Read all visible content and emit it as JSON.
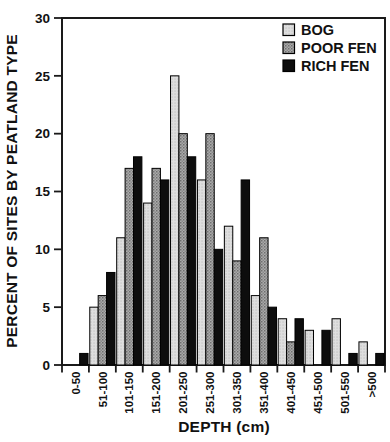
{
  "figure": {
    "background": "#ffffff",
    "frame_color": "#1a1a1a",
    "bar_outline_color": "#000000"
  },
  "chart_data": {
    "type": "bar",
    "title": "",
    "xlabel": "DEPTH (cm)",
    "ylabel": "PERCENT OF SITES BY PEATLAND TYPE",
    "ylim": [
      0,
      30
    ],
    "yticks": [
      0,
      5,
      10,
      15,
      20,
      25,
      30
    ],
    "grid": false,
    "legend_position": "top-right",
    "categories": [
      "0-50",
      "51-100",
      "101-150",
      "151-200",
      "201-250",
      "251-300",
      "301-350",
      "351-400",
      "401-450",
      "451-500",
      "501-550",
      ">500"
    ],
    "series": [
      {
        "name": "BOG",
        "pattern": "light-stipple",
        "fill_hex": "#d9d9d9",
        "values": [
          0,
          5,
          11,
          14,
          25,
          16,
          12,
          6,
          4,
          3,
          4,
          2
        ]
      },
      {
        "name": "POOR FEN",
        "pattern": "dark-stipple",
        "fill_hex": "#9c9c9c",
        "values": [
          0,
          6,
          17,
          17,
          20,
          20,
          9,
          11,
          2,
          0,
          0,
          0
        ]
      },
      {
        "name": "RICH FEN",
        "pattern": "solid",
        "fill_hex": "#0d0d0d",
        "values": [
          1,
          8,
          18,
          16,
          18,
          10,
          16,
          5,
          4,
          3,
          1,
          1
        ]
      }
    ]
  }
}
